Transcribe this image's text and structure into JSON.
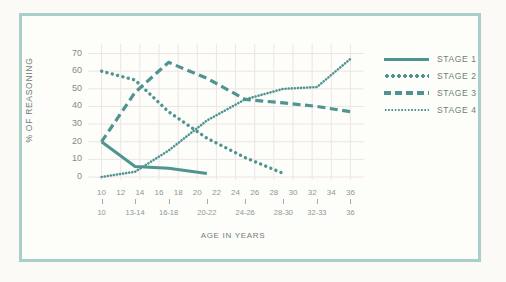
{
  "figure": {
    "background_color": "#fdfdfa",
    "border_color": "#a8cfca",
    "series_color": "#4f9490",
    "grid_color": "#eee4e4"
  },
  "chart_data": {
    "type": "line",
    "title": "",
    "xlabel": "AGE IN YEARS",
    "ylabel": "% OF REASONING",
    "ylim": [
      0,
      72
    ],
    "yticks": [
      0,
      10,
      20,
      30,
      40,
      50,
      60,
      70
    ],
    "xlim": [
      9,
      37
    ],
    "xticks_primary": [
      10,
      12,
      14,
      16,
      18,
      20,
      22,
      24,
      26,
      28,
      30,
      32,
      34,
      36
    ],
    "xticks_secondary": [
      "10",
      "13-14",
      "16-18",
      "20-22",
      "24-26",
      "28-30",
      "32-33",
      "36"
    ],
    "xticks_secondary_positions": [
      10,
      13.5,
      17,
      21,
      25,
      29,
      32.5,
      36
    ],
    "grid": true,
    "legend_position": "right",
    "series": [
      {
        "name": "STAGE 1",
        "style": "solid",
        "x": [
          10,
          13.5,
          17,
          21
        ],
        "values": [
          20,
          6,
          5,
          2
        ]
      },
      {
        "name": "STAGE 2",
        "style": "dotted-large",
        "x": [
          10,
          13.5,
          17,
          21,
          25,
          29
        ],
        "values": [
          60,
          55,
          37,
          22,
          11,
          2
        ]
      },
      {
        "name": "STAGE 3",
        "style": "dashed",
        "x": [
          10,
          13.5,
          17,
          21,
          25,
          29,
          32.5,
          36
        ],
        "values": [
          20,
          48,
          65,
          56,
          44,
          42,
          40,
          37
        ]
      },
      {
        "name": "STAGE 4",
        "style": "dotted-fine",
        "x": [
          10,
          13.5,
          17,
          21,
          25,
          29,
          32.5,
          36
        ],
        "values": [
          0,
          3,
          15,
          32,
          44,
          50,
          51,
          67
        ]
      }
    ]
  },
  "legend": {
    "items": [
      {
        "label": "STAGE 1",
        "style": "solid"
      },
      {
        "label": "STAGE 2",
        "style": "dotted-large"
      },
      {
        "label": "STAGE 3",
        "style": "dashed"
      },
      {
        "label": "STAGE 4",
        "style": "dotted-fine"
      }
    ]
  }
}
